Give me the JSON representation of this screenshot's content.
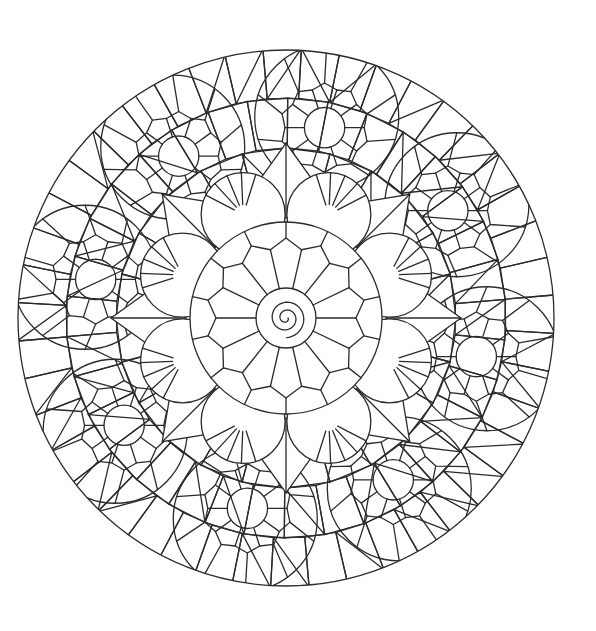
{
  "page": {
    "background": "#ffffff",
    "line_color": "#2b2b2b"
  },
  "mandala": {
    "center": [
      286,
      318
    ],
    "outer_radius": 268,
    "flower_radius": 96,
    "inner_ring_radius": 30,
    "petal_segments": 14,
    "star_points": 8,
    "medallion_count": 8,
    "medallion_radius": 72,
    "medallion_orbit": 205
  }
}
